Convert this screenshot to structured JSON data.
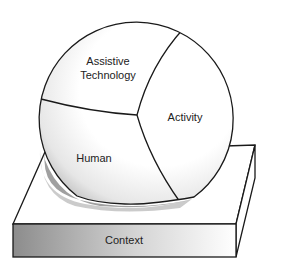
{
  "diagram": {
    "type": "sphere-on-platform",
    "sphere": {
      "segments": [
        {
          "id": "assistive-technology",
          "label_lines": [
            "Assistive",
            "Technology"
          ]
        },
        {
          "id": "activity",
          "label_lines": [
            "Activity"
          ]
        },
        {
          "id": "human",
          "label_lines": [
            "Human"
          ]
        }
      ]
    },
    "platform": {
      "label": "Context"
    },
    "colors": {
      "line": "#1a1a1a",
      "text": "#222222",
      "shadow": "#8a8a8a",
      "platform_front_dark": "#8c8c8c",
      "platform_front_light": "#ffffff"
    }
  }
}
